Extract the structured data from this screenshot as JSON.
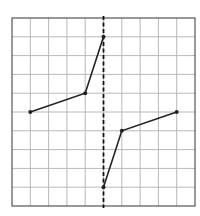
{
  "grid": {
    "columns": 10,
    "rows": 10,
    "origin_px": [
      12,
      18
    ],
    "cell_w": 18.3,
    "cell_h": 18.8,
    "line_color": "#b8b8b8",
    "border_color": "#555555"
  },
  "mirror_line": {
    "type": "dashed-vertical",
    "col": 5,
    "color": "#111111"
  },
  "shapes": [
    {
      "name": "original-shape",
      "points": [
        [
          1,
          5
        ],
        [
          4,
          4
        ],
        [
          5,
          1
        ]
      ],
      "color": "#222222"
    },
    {
      "name": "reflected-shape",
      "points": [
        [
          5,
          9
        ],
        [
          6,
          6
        ],
        [
          9,
          5
        ]
      ],
      "color": "#222222"
    }
  ]
}
